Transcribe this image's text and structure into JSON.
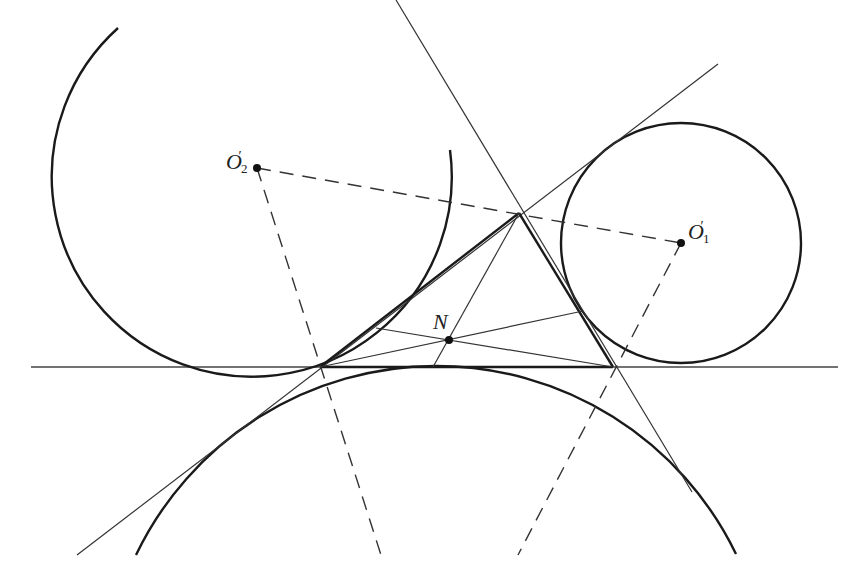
{
  "figure": {
    "colors": {
      "stroke": "#1a1a1a",
      "thin_stroke": "#333333",
      "background": "#ffffff"
    }
  },
  "labels": {
    "o2": {
      "letter": "O",
      "sub": "2",
      "prime": "′"
    },
    "o1": {
      "letter": "O",
      "sub": "1",
      "prime": "′"
    },
    "n": {
      "letter": "N"
    }
  },
  "points": {
    "O2_prime": {
      "x": 257,
      "y": 168
    },
    "O1_prime": {
      "x": 681,
      "y": 243
    },
    "N": {
      "x": 449,
      "y": 340
    },
    "A": {
      "x": 320,
      "y": 367
    },
    "B": {
      "x": 613,
      "y": 367
    },
    "C": {
      "x": 519,
      "y": 213
    }
  },
  "circles": [
    {
      "name": "circle-o2-prime",
      "cx": 257,
      "cy": 168,
      "r": 200
    },
    {
      "name": "circle-o1-prime",
      "cx": 681,
      "cy": 243,
      "r": 120
    },
    {
      "name": "circle-bottom",
      "cx": 433,
      "cy": 700,
      "r": 333
    }
  ]
}
